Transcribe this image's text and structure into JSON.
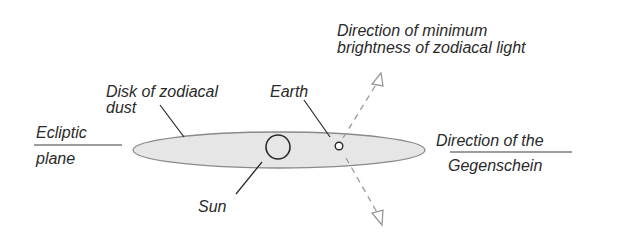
{
  "diagram": {
    "colors": {
      "ink": "#2a2a2a",
      "disk_fill": "#e6e6e6",
      "disk_stroke": "#8a8a8a",
      "dashed": "#9a9a9a"
    },
    "labels": {
      "ecliptic_line1": "Ecliptic",
      "ecliptic_line2": "plane",
      "disk_line1": "Disk of zodiacal",
      "disk_line2": "dust",
      "earth": "Earth",
      "min_brightness_line1": "Direction of minimum",
      "min_brightness_line2": "brightness of zodiacal light",
      "gegenschein_line1": "Direction of the",
      "gegenschein_line2": "Gegenschein",
      "sun": "Sun"
    },
    "elements": {
      "disk": {
        "cx": 279,
        "cy": 150,
        "rx": 146,
        "ry": 18
      },
      "sun": {
        "cx": 278,
        "cy": 147,
        "r": 12
      },
      "earth": {
        "cx": 339,
        "cy": 146,
        "r": 4
      }
    }
  }
}
